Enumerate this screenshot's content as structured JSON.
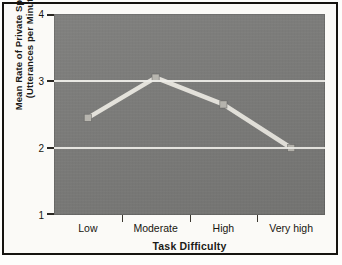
{
  "chart_data": {
    "type": "line",
    "title": "",
    "xlabel": "Task Difficulty",
    "ylabel_line1": "Mean Rate of Private Speech",
    "ylabel_line2": "(Utterances per Minute)",
    "categories": [
      "Low",
      "Moderate",
      "High",
      "Very high"
    ],
    "values": [
      2.45,
      3.05,
      2.65,
      2.0
    ],
    "series": [
      {
        "name": "Mean rate of private speech",
        "values": [
          2.45,
          3.05,
          2.65,
          2.0
        ]
      }
    ],
    "ylim": [
      1,
      4
    ],
    "yticks": [
      1,
      2,
      3,
      4
    ],
    "ytick_labels": [
      "1",
      "2",
      "3",
      "4"
    ],
    "gridlines": [
      2,
      3
    ],
    "grid": true,
    "legend": "none",
    "colors": {
      "plot_background": "#7a7a78",
      "line": "#e8e6df",
      "marker": "#b9b7b0",
      "gridline": "#f2f1ec",
      "axis_text": "#17150f",
      "frame": "#15130f",
      "page_background": "#fbfaf7"
    }
  }
}
